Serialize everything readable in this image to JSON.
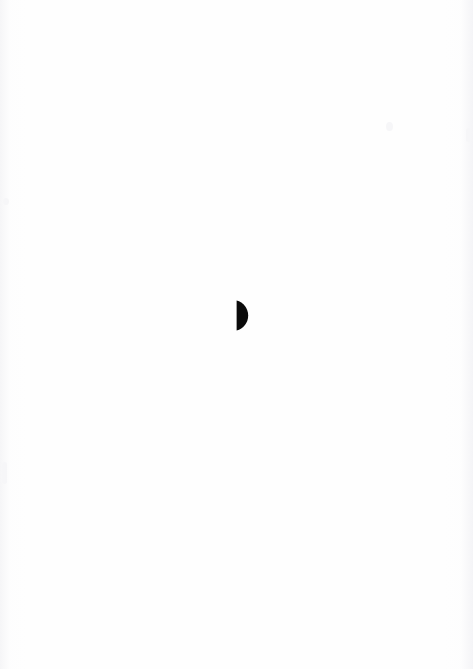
{
  "page": {
    "width": 473,
    "height": 669,
    "background_color": "#fefefe",
    "orientation": "portrait",
    "content_description": "Blank scanned page bearing a single solid black half-disc mark",
    "text_content": ""
  },
  "mark": {
    "name": "half-disc",
    "shape": "semicircle",
    "description": "Solid black half-disc with a flat vertical left edge and a convex curve on the right, resembling a filled D or waxing half-moon",
    "fill_color": "#0a0a0a",
    "x": 236,
    "y": 300,
    "width": 16,
    "height": 31,
    "center_x": 236,
    "center_y": 315.5,
    "radius": 15.5,
    "flat_edge": "left",
    "curve_side": "right"
  }
}
